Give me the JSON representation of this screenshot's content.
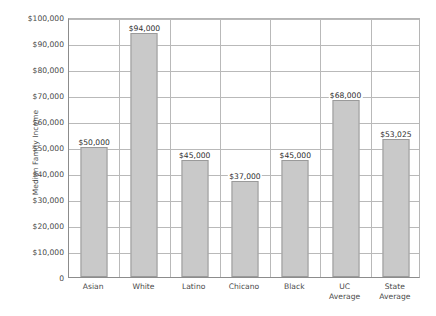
{
  "chart_data": {
    "type": "bar",
    "title": "",
    "xlabel": "",
    "ylabel": "Median Family Income",
    "categories": [
      "Asian",
      "White",
      "Latino",
      "Chicano",
      "Black",
      "UC Average",
      "State Average"
    ],
    "values": [
      50000,
      94000,
      45000,
      37000,
      45000,
      68000,
      53025
    ],
    "data_labels": [
      "$50,000",
      "$94,000",
      "$45,000",
      "$37,000",
      "$45,000",
      "$68,000",
      "$53,025"
    ],
    "ylim": [
      0,
      100000
    ],
    "ytick_values": [
      0,
      10000,
      20000,
      30000,
      40000,
      50000,
      60000,
      70000,
      80000,
      90000,
      100000
    ],
    "ytick_labels": [
      "0",
      "$10,000",
      "$20,000",
      "$30,000",
      "$40,000",
      "$50,000",
      "$60,000",
      "$70,000",
      "$80,000",
      "$90,000",
      "$100,000"
    ],
    "grid": true,
    "grid_axis": "both",
    "legend": false,
    "legend_position": "none",
    "bar_color": "#c9c9c9",
    "bar_border_color": "#9a9a9a",
    "gridline_color": "#b9b9b9",
    "axis_color": "#8c8c8c",
    "background_color": "#ffffff",
    "text_color": "#4a4a4a"
  },
  "caption": {
    "text": ""
  }
}
